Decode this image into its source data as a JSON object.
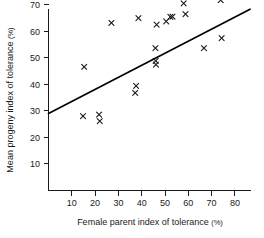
{
  "chart_data": {
    "type": "scatter",
    "title": "",
    "xlabel": "Female parent index of tolerance (%)",
    "ylabel": "Mean progeny index of tolerance (%)",
    "xlim": [
      0,
      87
    ],
    "ylim": [
      0,
      76
    ],
    "xticks": [
      10,
      20,
      30,
      40,
      50,
      60,
      70,
      80
    ],
    "yticks": [
      10,
      20,
      30,
      40,
      50,
      60,
      70
    ],
    "grid": false,
    "legend": null,
    "marker": "x",
    "marker_color": "#1a1a1a",
    "points": [
      {
        "x": 14.8,
        "y": 28.0
      },
      {
        "x": 15.3,
        "y": 46.6
      },
      {
        "x": 21.7,
        "y": 28.6
      },
      {
        "x": 22.0,
        "y": 26.1
      },
      {
        "x": 27.0,
        "y": 63.1
      },
      {
        "x": 37.2,
        "y": 36.8
      },
      {
        "x": 37.6,
        "y": 39.4
      },
      {
        "x": 38.6,
        "y": 64.9
      },
      {
        "x": 45.9,
        "y": 53.6
      },
      {
        "x": 46.0,
        "y": 48.8
      },
      {
        "x": 46.1,
        "y": 47.4
      },
      {
        "x": 46.4,
        "y": 62.5
      },
      {
        "x": 50.5,
        "y": 63.7
      },
      {
        "x": 52.3,
        "y": 65.4
      },
      {
        "x": 53.2,
        "y": 65.5
      },
      {
        "x": 58.0,
        "y": 70.5
      },
      {
        "x": 58.8,
        "y": 66.4
      },
      {
        "x": 66.7,
        "y": 53.6
      },
      {
        "x": 73.9,
        "y": 71.7
      },
      {
        "x": 74.3,
        "y": 57.4
      }
    ],
    "fit_line": {
      "type": "linear-regression",
      "x_start": 0,
      "y_start": 29.0,
      "x_end": 86.5,
      "y_end": 68.3
    }
  }
}
